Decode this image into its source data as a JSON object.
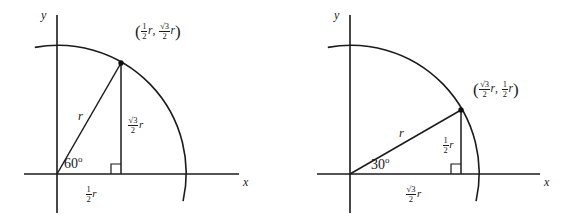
{
  "figure": {
    "colors": {
      "ink": "#1b1b1b",
      "background": "#ffffff"
    },
    "panels": [
      {
        "id": "panel-60",
        "angle_label": "60",
        "degree_symbol": "o",
        "hypotenuse_label": "r",
        "vertical_leg": {
          "numerator": "√3",
          "denominator": "2",
          "variable": "r"
        },
        "horizontal_leg": {
          "numerator": "1",
          "denominator": "2",
          "variable": "r"
        },
        "coordinate": {
          "open_paren": "(",
          "x": {
            "numerator": "1",
            "denominator": "2",
            "variable": "r"
          },
          "separator": ",",
          "y": {
            "numerator": "√3",
            "denominator": "2",
            "variable": "r"
          },
          "close_paren": ")"
        },
        "axis_x_label": "x",
        "axis_y_label": "y",
        "geometry": {
          "origin": [
            57,
            174
          ],
          "radius": 128,
          "angle_deg": 60,
          "point": [
            121,
            63
          ]
        }
      },
      {
        "id": "panel-30",
        "angle_label": "30",
        "degree_symbol": "o",
        "hypotenuse_label": "r",
        "vertical_leg": {
          "numerator": "1",
          "denominator": "2",
          "variable": "r"
        },
        "horizontal_leg": {
          "numerator": "√3",
          "denominator": "2",
          "variable": "r"
        },
        "coordinate": {
          "open_paren": "(",
          "x": {
            "numerator": "√3",
            "denominator": "2",
            "variable": "r"
          },
          "separator": ",",
          "y": {
            "numerator": "1",
            "denominator": "2",
            "variable": "r"
          },
          "close_paren": ")"
        },
        "axis_x_label": "x",
        "axis_y_label": "y",
        "geometry": {
          "origin": [
            350,
            174
          ],
          "radius": 128,
          "angle_deg": 30,
          "point": [
            461,
            110
          ]
        }
      }
    ]
  }
}
